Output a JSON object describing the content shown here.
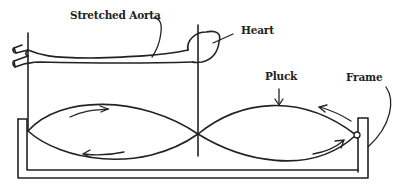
{
  "diagram": {
    "type": "physical model illustration",
    "labels": {
      "aorta": "Stretched Aorta",
      "heart": "Heart",
      "pluck": "Pluck",
      "frame": "Frame"
    },
    "colors": {
      "ink": "#222222",
      "background": "#ffffff"
    },
    "elements": [
      "stretched-aorta-tube",
      "heart",
      "left-post",
      "center-post",
      "vibrating-string-two-loops",
      "motion-arrows",
      "frame",
      "string-anchor-ring"
    ]
  }
}
